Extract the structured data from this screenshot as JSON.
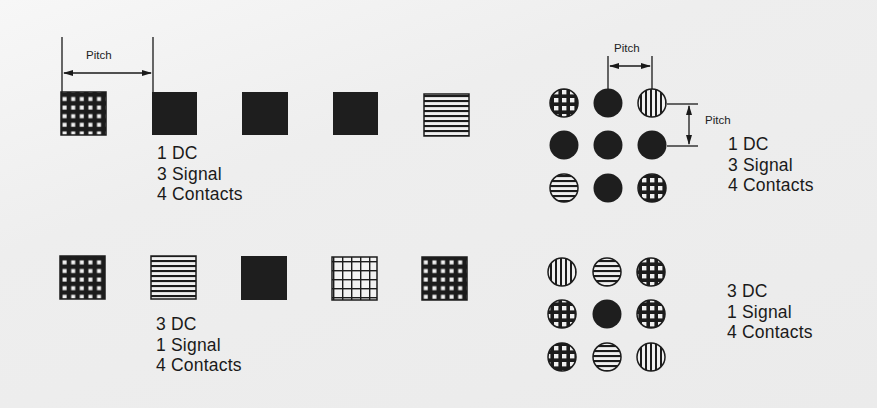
{
  "diagram": {
    "title": "",
    "background": "#ececec",
    "ink": "#1a1a1a",
    "pitch_label": "Pitch",
    "pattern_legend": [
      "solid",
      "horizontal-stripes",
      "vertical-stripes",
      "fine-grid",
      "open-grid"
    ],
    "linear_layouts": [
      {
        "name": "linear-1dc-3signal",
        "contacts": [
          "fine-grid",
          "solid",
          "solid",
          "solid",
          "horizontal-stripes"
        ],
        "caption": {
          "line1": "1 DC",
          "line2": "3 Signal",
          "line3": "4 Contacts"
        }
      },
      {
        "name": "linear-3dc-1signal",
        "contacts": [
          "fine-grid",
          "horizontal-stripes",
          "solid",
          "open-grid",
          "fine-grid"
        ],
        "caption": {
          "line1": "3 DC",
          "line2": "1 Signal",
          "line3": "4 Contacts"
        }
      }
    ],
    "grid_layouts": [
      {
        "name": "grid-1dc-3signal",
        "rows": [
          [
            "grid-circle",
            "solid",
            "vertical-stripes"
          ],
          [
            "solid",
            "solid",
            "solid"
          ],
          [
            "horizontal-stripes",
            "solid",
            "grid-circle"
          ]
        ],
        "caption": {
          "line1": "1 DC",
          "line2": "3 Signal",
          "line3": "4 Contacts"
        }
      },
      {
        "name": "grid-3dc-1signal",
        "rows": [
          [
            "vertical-stripes",
            "horizontal-stripes",
            "grid-circle"
          ],
          [
            "grid-circle",
            "solid",
            "grid-circle"
          ],
          [
            "grid-circle",
            "horizontal-stripes",
            "vertical-stripes"
          ]
        ],
        "caption": {
          "line1": "3 DC",
          "line2": "1 Signal",
          "line3": "4 Contacts"
        }
      }
    ]
  }
}
